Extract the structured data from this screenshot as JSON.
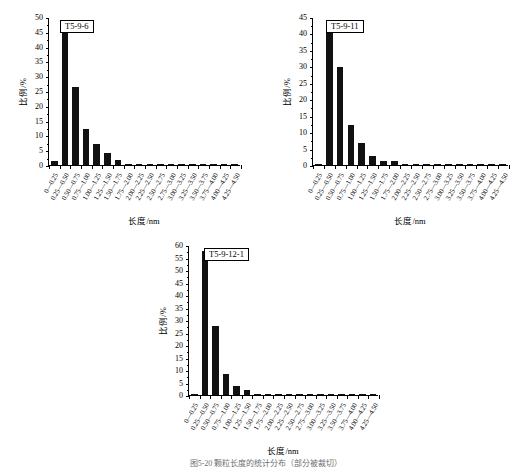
{
  "figure": {
    "caption": "图5-20  颗粒长度的统计分布（部分被裁切）"
  },
  "axis": {
    "ylabel": "比例/%",
    "xlabel": "长度/nm",
    "bins": [
      "0—0.25",
      "0.25—0.50",
      "0.50—0.75",
      "0.75—1.00",
      "1.00—1.25",
      "1.25—1.50",
      "1.50—1.75",
      "1.75—2.00",
      "2.00—2.25",
      "2.25—2.50",
      "2.50—2.75",
      "2.75—3.00",
      "3.00—3.25",
      "3.25—3.50",
      "3.50—3.75",
      "3.75—4.00",
      "4.00—4.25",
      "4.25—4.50"
    ]
  },
  "chart_data": [
    {
      "type": "bar",
      "title": "T5-9-6",
      "xlabel": "长度/nm",
      "ylabel": "比例/%",
      "ylim": [
        0,
        50
      ],
      "ytick_step": 5,
      "yticks": [
        0,
        5,
        10,
        15,
        20,
        25,
        30,
        35,
        40,
        45,
        50
      ],
      "grid": false,
      "legend": "none",
      "categories": [
        "0—0.25",
        "0.25—0.50",
        "0.50—0.75",
        "0.75—1.00",
        "1.00—1.25",
        "1.25—1.50",
        "1.50—1.75",
        "1.75—2.00",
        "2.00—2.25",
        "2.25—2.50",
        "2.50—2.75",
        "2.75—3.00",
        "3.00—3.25",
        "3.25—3.50",
        "3.50—3.75",
        "3.75—4.00",
        "4.00—4.25",
        "4.25—4.50"
      ],
      "values": [
        1.2,
        45.0,
        26.5,
        12.2,
        7.1,
        4.1,
        1.8,
        0.3,
        0.2,
        0.2,
        0.1,
        0.1,
        0.1,
        0.1,
        0.1,
        0.1,
        0.1,
        0.1
      ]
    },
    {
      "type": "bar",
      "title": "T5-9-11",
      "xlabel": "长度/nm",
      "ylabel": "比例/%",
      "ylim": [
        0,
        45
      ],
      "ytick_step": 5,
      "yticks": [
        0,
        5,
        10,
        15,
        20,
        25,
        30,
        35,
        40,
        45
      ],
      "grid": false,
      "legend": "none",
      "categories": [
        "0—0.25",
        "0.25—0.50",
        "0.50—0.75",
        "0.75—1.00",
        "1.00—1.25",
        "1.25—1.50",
        "1.50—1.75",
        "1.75—2.00",
        "2.00—2.25",
        "2.25—2.50",
        "2.50—2.75",
        "2.75—3.00",
        "3.00—3.25",
        "3.25—3.50",
        "3.50—3.75",
        "3.75—4.00",
        "4.00—4.25",
        "4.25—4.50"
      ],
      "values": [
        0.4,
        44.2,
        29.8,
        12.3,
        6.6,
        2.7,
        1.3,
        1.3,
        0.4,
        0.2,
        0.1,
        0.1,
        0.1,
        0.1,
        0.1,
        0.1,
        0.1,
        0.1
      ]
    },
    {
      "type": "bar",
      "title": "T5-9-12-1",
      "xlabel": "长度/nm",
      "ylabel": "比例/%",
      "ylim": [
        0,
        60
      ],
      "ytick_step": 5,
      "yticks": [
        0,
        5,
        10,
        15,
        20,
        25,
        30,
        35,
        40,
        45,
        50,
        55,
        60
      ],
      "grid": false,
      "legend": "none",
      "categories": [
        "0—0.25",
        "0.25—0.50",
        "0.50—0.75",
        "0.75—1.00",
        "1.00—1.25",
        "1.25—1.50",
        "1.50—1.75",
        "1.75—2.00",
        "2.00—2.25",
        "2.25—2.50",
        "2.50—2.75",
        "2.75—3.00",
        "3.00—3.25",
        "3.25—3.50",
        "3.50—3.75",
        "3.75—4.00",
        "4.00—4.25",
        "4.25—4.50"
      ],
      "values": [
        0.4,
        57.8,
        27.5,
        8.5,
        3.7,
        2.2,
        0.3,
        0.2,
        0.2,
        0.2,
        0.1,
        0.1,
        0.1,
        0.1,
        0.1,
        0.1,
        0.1,
        0.1
      ]
    }
  ]
}
